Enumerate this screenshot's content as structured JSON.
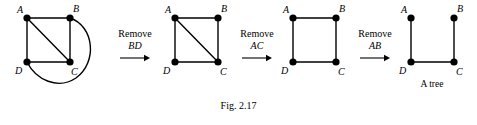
{
  "figure": {
    "caption": "Fig. 2.17",
    "tree_caption": "A tree"
  },
  "vertices": {
    "a": "A",
    "b": "B",
    "c": "C",
    "d": "D"
  },
  "panels": [
    {
      "id": "graph-1",
      "name": "complete-graph-with-multi-edge",
      "vertex_labels": {
        "a": "A",
        "b": "B",
        "c": "C",
        "d": "D"
      },
      "edges": [
        "AB",
        "AD",
        "AC",
        "BC",
        "DC",
        "BD"
      ],
      "has_diagonal_ac": true,
      "has_curved_bd": true
    },
    {
      "id": "graph-2",
      "name": "square-with-diagonal",
      "vertex_labels": {
        "a": "A",
        "b": "B",
        "c": "C",
        "d": "D"
      },
      "edges": [
        "AB",
        "AD",
        "AC",
        "BC",
        "DC"
      ],
      "has_diagonal_ac": true,
      "has_curved_bd": false
    },
    {
      "id": "graph-3",
      "name": "square-cycle",
      "vertex_labels": {
        "a": "A",
        "b": "B",
        "c": "C",
        "d": "D"
      },
      "edges": [
        "AB",
        "AD",
        "BC",
        "DC"
      ],
      "has_diagonal_ac": false,
      "has_curved_bd": false
    },
    {
      "id": "graph-4",
      "name": "spanning-tree",
      "vertex_labels": {
        "a": "A",
        "b": "B",
        "c": "C",
        "d": "D"
      },
      "edges": [
        "AD",
        "DC",
        "BC"
      ],
      "has_diagonal_ac": false,
      "has_curved_bd": false,
      "caption": "A tree"
    }
  ],
  "operations": [
    {
      "id": "op-1",
      "verb": "Remove",
      "edge": "BD",
      "arrow": "right-arrow-icon"
    },
    {
      "id": "op-2",
      "verb": "Remove",
      "edge": "AC",
      "arrow": "right-arrow-icon"
    },
    {
      "id": "op-3",
      "verb": "Remove",
      "edge": "AB",
      "arrow": "right-arrow-icon"
    }
  ],
  "colors": {
    "ink": "#000000",
    "background": "#ffffff"
  }
}
